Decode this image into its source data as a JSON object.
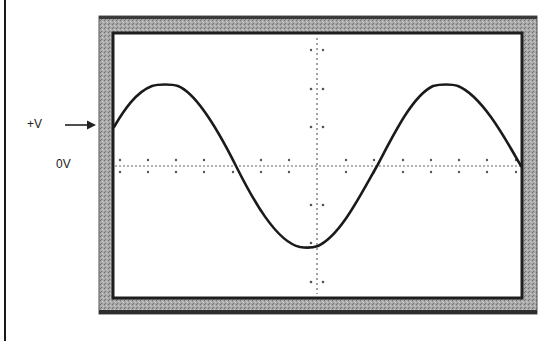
{
  "diagram": {
    "type": "oscilloscope-display",
    "labels": {
      "plus_v": "+V",
      "zero_v": "0V"
    },
    "arrow": {
      "points_to": "+V level on left edge of screen"
    },
    "waveform": {
      "shape": "sine",
      "cycles_visible": 1.5,
      "start_level": "+V (mid-positive)",
      "description": "Sine wave starting at +V, rising to positive peak, falling through 0V to negative trough at center graticule, rising to second positive peak, then back to 0V at right edge"
    },
    "graticule": {
      "horizontal_axis": "0V center line, dotted with tick marks",
      "vertical_axis": "center vertical line, dotted with tick marks"
    },
    "colors": {
      "frame": "#9a9a9a",
      "frame_dark": "#2a2a2a",
      "screen": "#ffffff",
      "trace": "#1a1a1a"
    }
  }
}
